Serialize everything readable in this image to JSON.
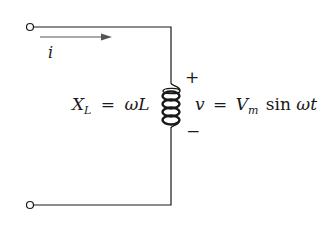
{
  "diagram": {
    "title": "",
    "type": "circuit",
    "colors": {
      "line": "#1a1a1a",
      "arrow": "#555555",
      "background": "#ffffff"
    },
    "current": {
      "symbol": "i"
    },
    "reactance": {
      "symbol": "X",
      "subscript": "L",
      "equals": "=",
      "expression": "ωL"
    },
    "voltage": {
      "plus": "+",
      "minus": "−",
      "symbol": "v",
      "equals": "=",
      "amplitude": "V",
      "amplitude_subscript": "m",
      "function": "sin",
      "argument": "ωt"
    },
    "components": [
      {
        "type": "terminal",
        "position": "top-left"
      },
      {
        "type": "terminal",
        "position": "bottom-left"
      },
      {
        "type": "inductor",
        "label": "L"
      }
    ]
  }
}
